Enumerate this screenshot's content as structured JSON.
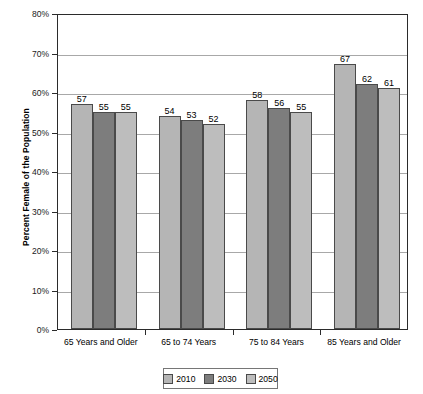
{
  "chart_data": {
    "type": "bar",
    "title": "",
    "xlabel": "",
    "ylabel": "Percent Female of the Population",
    "categories": [
      "65 Years and Older",
      "65 to 74 Years",
      "75 to 84 Years",
      "85 Years and Older"
    ],
    "series": [
      {
        "name": "2010",
        "values": [
          57,
          54,
          58,
          67
        ],
        "color": "#b5b5b5"
      },
      {
        "name": "2030",
        "values": [
          55,
          53,
          56,
          62
        ],
        "color": "#7d7d7d"
      },
      {
        "name": "2050",
        "values": [
          55,
          52,
          55,
          61
        ],
        "color": "#bdbdbd"
      }
    ],
    "ylim": [
      0,
      80
    ],
    "y_ticks": [
      0,
      10,
      20,
      30,
      40,
      50,
      60,
      70,
      80
    ],
    "y_tick_labels": [
      "0%",
      "10%",
      "20%",
      "30%",
      "40%",
      "50%",
      "60%",
      "70%",
      "80%"
    ],
    "grid": true,
    "legend_position": "bottom-center",
    "value_labels": true
  },
  "legend": {
    "items": [
      {
        "label": "2010"
      },
      {
        "label": "2030"
      },
      {
        "label": "2050"
      }
    ]
  },
  "colors": {
    "series_2010": "#b5b5b5",
    "series_2030": "#7d7d7d",
    "series_2050": "#bdbdbd",
    "axis": "#2b2b2b",
    "gridline": "#a8a8a8",
    "bar_border": "#4a4a4a"
  }
}
